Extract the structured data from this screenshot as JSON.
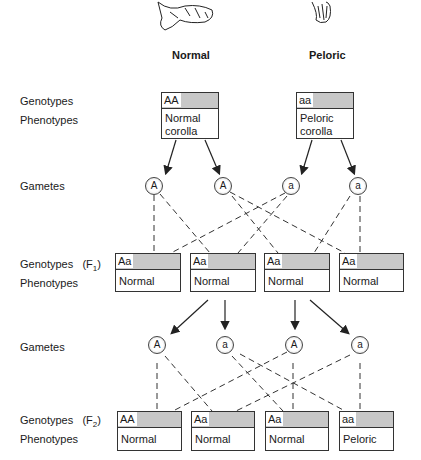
{
  "parents": {
    "normal": {
      "title": "Normal",
      "genotype": "AA",
      "phenotype_line1": "Normal",
      "phenotype_line2": "corolla"
    },
    "peloric": {
      "title": "Peloric",
      "genotype": "aa",
      "phenotype_line1": "Peloric",
      "phenotype_line2": "corolla"
    }
  },
  "row_labels": {
    "genotypes": "Genotypes",
    "phenotypes": "Phenotypes",
    "gametes": "Gametes",
    "gametes2": "Gametes",
    "genotypes_f1": "Genotypes",
    "f1_tag": "(F",
    "f1_sub": "1",
    "f1_close": ")",
    "phenotypes_f1": "Phenotypes",
    "genotypes_f2": "Genotypes",
    "f2_tag": "(F",
    "f2_sub": "2",
    "f2_close": ")",
    "phenotypes_f2": "Phenotypes"
  },
  "gametes_p": [
    "A",
    "A",
    "a",
    "a"
  ],
  "f1": [
    {
      "genotype": "Aa",
      "phenotype": "Normal"
    },
    {
      "genotype": "Aa",
      "phenotype": "Normal"
    },
    {
      "genotype": "Aa",
      "phenotype": "Normal"
    },
    {
      "genotype": "Aa",
      "phenotype": "Normal"
    }
  ],
  "gametes_f1": [
    "A",
    "a",
    "A",
    "a"
  ],
  "f2": [
    {
      "genotype": "AA",
      "phenotype": "Normal"
    },
    {
      "genotype": "Aa",
      "phenotype": "Normal"
    },
    {
      "genotype": "Aa",
      "phenotype": "Normal"
    },
    {
      "genotype": "aa",
      "phenotype": "Peloric"
    }
  ]
}
